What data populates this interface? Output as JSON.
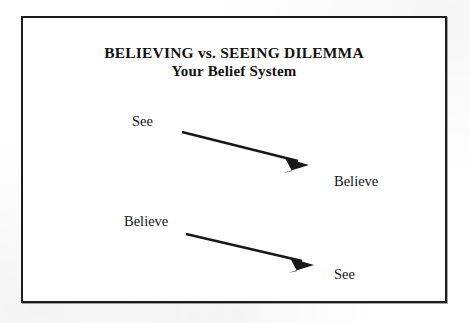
{
  "diagram": {
    "title": "BELIEVING vs. SEEING DILEMMA",
    "subtitle": "Your Belief System",
    "border_color": "#1d1d1d",
    "text_color": "#141414",
    "background_color": "#ffffff",
    "rows": [
      {
        "source_label": "See",
        "target_label": "Believe",
        "arrow_name": "arrow-see-to-believe",
        "direction": "down-right"
      },
      {
        "source_label": "Believe",
        "target_label": "See",
        "arrow_name": "arrow-believe-to-see",
        "direction": "down-right"
      }
    ]
  }
}
